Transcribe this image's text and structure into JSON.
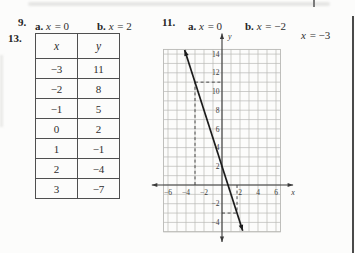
{
  "page": {
    "problem9": {
      "number": "9.",
      "parts": [
        {
          "label": "a.",
          "var": "x",
          "rest": " = 0"
        },
        {
          "label": "b.",
          "var": "x",
          "rest": " = 2"
        }
      ]
    },
    "problem11": {
      "number": "11.",
      "parts": [
        {
          "label": "a.",
          "var": "x",
          "rest": " = 0"
        },
        {
          "label": "b.",
          "var": "x",
          "rest": " = −2"
        }
      ],
      "extra": {
        "var": "x",
        "rest": " = −3"
      }
    },
    "problem13": {
      "number": "13.",
      "table": {
        "headers": [
          "x",
          "y"
        ],
        "rows": [
          [
            "−3",
            "11"
          ],
          [
            "−2",
            "8"
          ],
          [
            "−1",
            "5"
          ],
          [
            "0",
            "2"
          ],
          [
            "1",
            "−1"
          ],
          [
            "2",
            "−4"
          ],
          [
            "3",
            "−7"
          ]
        ]
      }
    }
  },
  "chart_data": {
    "type": "line",
    "title": "",
    "equation": "y = -3x + 2",
    "points": [
      [
        -3,
        11
      ],
      [
        -2,
        8
      ],
      [
        -1,
        5
      ],
      [
        0,
        2
      ],
      [
        1,
        -1
      ],
      [
        2,
        -4
      ],
      [
        3,
        -7
      ]
    ],
    "line_segment": {
      "from": [
        -4.15,
        14.45
      ],
      "to": [
        2.3,
        -4.9
      ]
    },
    "axes": {
      "xlabel": "x",
      "ylabel": "y",
      "xlim": [
        -6.5,
        6.5
      ],
      "ylim": [
        -5,
        14.5
      ],
      "x_axis_ends": [
        -7.8,
        7.9
      ],
      "y_axis_ends": [
        -6.1,
        16.2
      ],
      "x_ticks": [
        -6,
        -4,
        -2,
        2,
        4,
        6
      ],
      "y_ticks": [
        14,
        12,
        10,
        8,
        6,
        4,
        2,
        -2,
        -4
      ],
      "grid": true
    },
    "dashed_guides": [
      {
        "from": [
          -3,
          0
        ],
        "to": [
          -3,
          11
        ]
      },
      {
        "from": [
          -3,
          11
        ],
        "to": [
          0,
          11
        ]
      },
      {
        "from": [
          1.67,
          0
        ],
        "to": [
          1.67,
          -3
        ]
      },
      {
        "from": [
          0,
          -3
        ],
        "to": [
          1.67,
          -3
        ]
      }
    ],
    "colors": {
      "grid": "#b9b9b6",
      "axis": "#3a3a3a",
      "line": "#1c1c1c",
      "dashed": "#3a3a3a",
      "text": "#3a3a3a"
    }
  }
}
